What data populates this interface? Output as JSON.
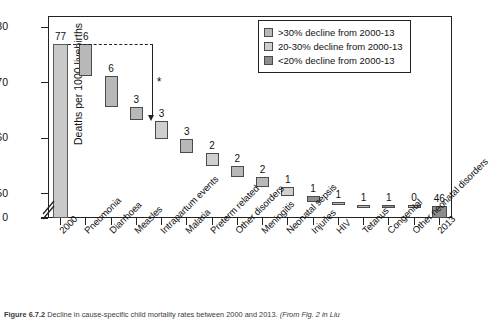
{
  "figure": {
    "caption_number": "Figure 6.7.2",
    "caption_text": "Decline in cause-specific child mortality rates between 2000 and 2013.",
    "caption_source": "(From Fig. 2 in Liu"
  },
  "legend": {
    "items": [
      {
        "label": ">30% decline from 2000-13",
        "color": "#b8b8b8",
        "key": "g30"
      },
      {
        "label": "20-30% decline from 2000-13",
        "color": "#cfcfcf",
        "key": "g2030"
      },
      {
        "label": "<20% decline from 2000-13",
        "color": "#8d8d8d",
        "key": "g20"
      }
    ]
  },
  "annotation": {
    "asterisk": "*"
  },
  "chart_data": {
    "type": "bar",
    "subtype": "waterfall",
    "title": "",
    "xlabel": "",
    "ylabel": "Deaths per 1000 livebirths",
    "ylim": [
      0,
      82
    ],
    "y_ticks": [
      0,
      50,
      60,
      70,
      80
    ],
    "y_tick_labels": [
      "0",
      "50",
      "60",
      "70",
      "80"
    ],
    "axis_break": true,
    "axis_break_between": [
      0,
      50
    ],
    "grid": false,
    "legend_position": "top-right",
    "categories": [
      "2000",
      "Pneumonia",
      "Diarrhoea",
      "Measles",
      "Intrapartum events",
      "Malaria",
      "Preterm related",
      "Other disorders",
      "Meningitis",
      "Neonatal sepsis",
      "Injuries",
      "HIV",
      "Tetanus",
      "Congenital",
      "Other neonatal disorders",
      "2013"
    ],
    "data_labels": [
      "77",
      "6",
      "6",
      "3",
      "3",
      "3",
      "2",
      "2",
      "2",
      "1",
      "1",
      "1",
      "1",
      "0",
      "",
      "46"
    ],
    "bars": [
      {
        "category": "2000",
        "label": "77",
        "kind": "total",
        "group": "total",
        "start": 0,
        "end": 77,
        "value": 77
      },
      {
        "category": "Pneumonia",
        "label": "6",
        "kind": "decrement",
        "group": "g30",
        "start": 71.2,
        "end": 77,
        "value": 5.8
      },
      {
        "category": "Diarrhoea",
        "label": "6",
        "kind": "decrement",
        "group": "g30",
        "start": 65.7,
        "end": 71.2,
        "value": 5.5
      },
      {
        "category": "Measles",
        "label": "3",
        "kind": "decrement",
        "group": "g30",
        "start": 63.2,
        "end": 65.7,
        "value": 2.5
      },
      {
        "category": "Intrapartum events",
        "label": "3",
        "kind": "decrement",
        "group": "g2030",
        "start": 59.9,
        "end": 63.2,
        "value": 3.3
      },
      {
        "category": "Malaria",
        "label": "3",
        "kind": "decrement",
        "group": "g30",
        "start": 57.4,
        "end": 59.9,
        "value": 2.5
      },
      {
        "category": "Preterm related",
        "label": "2",
        "kind": "decrement",
        "group": "g2030",
        "start": 55.1,
        "end": 57.4,
        "value": 2.3
      },
      {
        "category": "Other disorders",
        "label": "2",
        "kind": "decrement",
        "group": "g30",
        "start": 53.0,
        "end": 55.1,
        "value": 2.1
      },
      {
        "category": "Meningitis",
        "label": "2",
        "kind": "decrement",
        "group": "g30",
        "start": 51.2,
        "end": 53.0,
        "value": 1.8
      },
      {
        "category": "Neonatal sepsis",
        "label": "1",
        "kind": "decrement",
        "group": "g2030",
        "start": 49.7,
        "end": 51.2,
        "value": 1.5
      },
      {
        "category": "Injuries",
        "label": "1",
        "kind": "decrement",
        "group": "g20",
        "start": 48.6,
        "end": 49.7,
        "value": 1.1
      },
      {
        "category": "HIV",
        "label": "1",
        "kind": "decrement",
        "group": "g30",
        "start": 47.7,
        "end": 48.6,
        "value": 0.9
      },
      {
        "category": "Tetanus",
        "label": "1",
        "kind": "decrement",
        "group": "g30",
        "start": 47.0,
        "end": 47.7,
        "value": 0.7
      },
      {
        "category": "Congenital",
        "label": "1",
        "kind": "decrement",
        "group": "g20",
        "start": 46.4,
        "end": 47.0,
        "value": 0.6
      },
      {
        "category": "Other neonatal disorders",
        "label": "0",
        "kind": "decrement",
        "group": "g2030",
        "start": 46.0,
        "end": 46.4,
        "value": 0.4
      },
      {
        "category": "2013",
        "label": "46",
        "kind": "total",
        "group": "g20",
        "start": 0,
        "end": 46,
        "value": 46
      }
    ]
  }
}
